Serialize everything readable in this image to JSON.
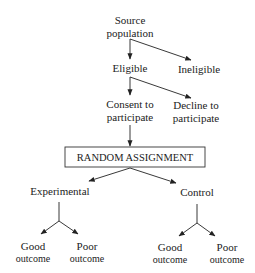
{
  "diagram": {
    "type": "flowchart",
    "title": "",
    "nodes": {
      "source": {
        "line1": "Source",
        "line2": "population"
      },
      "eligible": {
        "label": "Eligible"
      },
      "ineligible": {
        "label": "Ineligible"
      },
      "consent": {
        "line1": "Consent to",
        "line2": "participate"
      },
      "decline": {
        "line1": "Decline to",
        "line2": "participate"
      },
      "random": {
        "label": "RANDOM ASSIGNMENT"
      },
      "experimental": {
        "label": "Experimental"
      },
      "control": {
        "label": "Control"
      },
      "exp_good": {
        "line1": "Good",
        "line2": "outcome"
      },
      "exp_poor": {
        "line1": "Poor",
        "line2": "outcome"
      },
      "ctrl_good": {
        "line1": "Good",
        "line2": "outcome"
      },
      "ctrl_poor": {
        "line1": "Poor",
        "line2": "outcome"
      }
    },
    "edges": [
      {
        "from": "source",
        "to": "eligible"
      },
      {
        "from": "source",
        "to": "ineligible"
      },
      {
        "from": "eligible",
        "to": "consent"
      },
      {
        "from": "eligible",
        "to": "decline"
      },
      {
        "from": "consent",
        "to": "random"
      },
      {
        "from": "random",
        "to": "experimental"
      },
      {
        "from": "random",
        "to": "control"
      },
      {
        "from": "experimental",
        "to": "exp_good"
      },
      {
        "from": "experimental",
        "to": "exp_poor"
      },
      {
        "from": "control",
        "to": "ctrl_good"
      },
      {
        "from": "control",
        "to": "ctrl_poor"
      }
    ],
    "colors": {
      "line": "#222222",
      "text": "#222222",
      "background": "#ffffff"
    }
  }
}
